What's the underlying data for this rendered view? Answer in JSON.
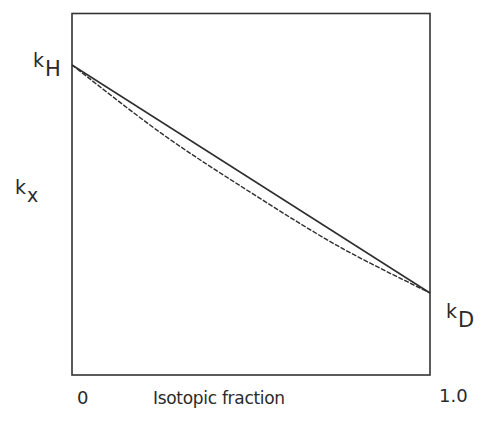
{
  "chart_data": {
    "type": "line",
    "title": "",
    "xlabel": "Isotopic fraction",
    "ylabel": "k_x",
    "x_tick_labels": [
      "0",
      "1.0"
    ],
    "xlim": [
      0,
      1.0
    ],
    "grid": false,
    "legend": null,
    "y_annotations": [
      {
        "text": "k",
        "subscript": "H",
        "at_x": 0,
        "position": "left of y-axis at line start"
      },
      {
        "text": "k",
        "subscript": "x",
        "position": "y-axis label"
      },
      {
        "text": "k",
        "subscript": "D",
        "at_x": 1.0,
        "position": "right of plot at line end"
      }
    ],
    "x": [
      0,
      0.25,
      0.5,
      0.75,
      1.0
    ],
    "series": [
      {
        "name": "linear (solid)",
        "style": "solid",
        "values": [
          1.0,
          0.75,
          0.5,
          0.25,
          0.0
        ]
      },
      {
        "name": "curved (dashed)",
        "style": "dashed",
        "values": [
          1.0,
          0.7,
          0.44,
          0.2,
          0.0
        ]
      }
    ],
    "value_note": "y values normalized: k_H = 1, k_D = 0"
  },
  "labels": {
    "kH_main": "k",
    "kH_sub": "H",
    "kx_main": "k",
    "kx_sub": "x",
    "kD_main": "k",
    "kD_sub": "D",
    "x_tick_start": "0",
    "x_tick_end": "1.0",
    "x_axis_title": "Isotopic fraction"
  },
  "colors": {
    "frame": "#333333",
    "line": "#2e2e2e",
    "text": "#2a2a2a"
  }
}
